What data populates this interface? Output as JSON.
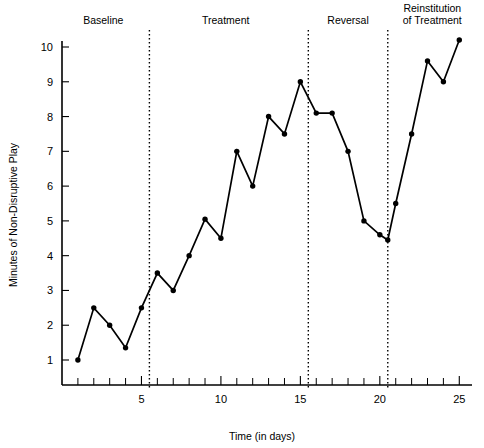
{
  "chart_data": {
    "type": "line",
    "title": "",
    "xlabel": "Time (in days)",
    "ylabel": "Minutes of Non-Disruptive Play",
    "xlim": [
      0,
      25.8
    ],
    "ylim": [
      0,
      10.6
    ],
    "grid": false,
    "legend": "none",
    "x_ticks_major": [
      5,
      10,
      15,
      20,
      25
    ],
    "x_ticks_minor": [
      1,
      2,
      3,
      4,
      6,
      7,
      8,
      9,
      11,
      12,
      13,
      14,
      16,
      17,
      18,
      19,
      21,
      22,
      23,
      24
    ],
    "x_tick_labels": [
      "5",
      "10",
      "15",
      "20",
      "25"
    ],
    "y_ticks": [
      1,
      2,
      3,
      4,
      5,
      6,
      7,
      8,
      9,
      10
    ],
    "y_tick_labels": [
      "1",
      "2",
      "3",
      "4",
      "5",
      "6",
      "7",
      "8",
      "9",
      "10"
    ],
    "x": [
      1,
      2,
      3,
      4,
      5,
      6,
      7,
      8,
      9,
      10,
      11,
      12,
      13,
      14,
      15,
      16,
      17,
      18,
      19,
      20,
      20.5,
      21,
      22,
      23,
      24,
      25
    ],
    "values": [
      1.0,
      2.5,
      2.0,
      1.35,
      2.5,
      3.5,
      3.0,
      4.0,
      5.05,
      4.5,
      7.0,
      6.0,
      8.0,
      7.5,
      9.0,
      8.1,
      8.1,
      7.0,
      5.0,
      4.6,
      4.45,
      5.5,
      7.5,
      9.6,
      9.0,
      10.2
    ],
    "phases": [
      {
        "label": "Baseline",
        "start": 0,
        "end": 5.5,
        "label_x": 2.6
      },
      {
        "label": "Treatment",
        "start": 5.5,
        "end": 15.5,
        "label_x": 10.3
      },
      {
        "label": "Reversal",
        "start": 15.5,
        "end": 20.5,
        "label_x": 18.0
      },
      {
        "label": "Reinstitution of Treatment",
        "start": 20.5,
        "end": 25.8,
        "label_x": 23.3
      }
    ],
    "dividers": [
      5.5,
      15.5,
      20.5
    ],
    "line_color": "#000000",
    "marker_color": "#000000",
    "background_color": "#ffffff"
  }
}
